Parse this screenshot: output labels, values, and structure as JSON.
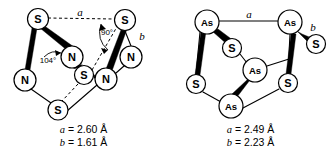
{
  "figure": {
    "panels": [
      {
        "id": "s4n4",
        "name": "tetrasulfur-tetranitride-cage",
        "atoms": [
          {
            "label": "S",
            "x": 38,
            "y": 19,
            "r": 10.5,
            "size": "sz1"
          },
          {
            "label": "S",
            "x": 125,
            "y": 20,
            "r": 10.5,
            "size": "sz1"
          },
          {
            "label": "N",
            "x": 72,
            "y": 57,
            "r": 11.0,
            "size": "sz1"
          },
          {
            "label": "N",
            "x": 131,
            "y": 57,
            "r": 11.0,
            "size": "sz1"
          },
          {
            "label": "N",
            "x": 25,
            "y": 80,
            "r": 11.0,
            "size": "sz1"
          },
          {
            "label": "S",
            "x": 84,
            "y": 75,
            "r": 9.5,
            "size": "sz1"
          },
          {
            "label": "N",
            "x": 106,
            "y": 79,
            "r": 11.0,
            "size": "sz1"
          },
          {
            "label": "S",
            "x": 58,
            "y": 110,
            "r": 10.0,
            "size": "sz1"
          }
        ],
        "measure_labels": [
          {
            "text": "a",
            "x": 80,
            "y": 12
          },
          {
            "text": "b",
            "x": 142,
            "y": 36
          }
        ],
        "angle_labels": [
          {
            "text": "104°",
            "x": 48,
            "y": 60
          },
          {
            "text": "90°",
            "x": 107,
            "y": 32
          }
        ],
        "caption": {
          "line1_symbol": "a",
          "line1_value": "= 2.60 Å",
          "line2_symbol": "b",
          "line2_value": "= 1.61 Å"
        }
      },
      {
        "id": "as4s4",
        "name": "tetraarsenic-tetrasulfide-cage",
        "atoms": [
          {
            "label": "As",
            "x": 40,
            "y": 22,
            "r": 12.0,
            "size": "sz2"
          },
          {
            "label": "As",
            "x": 123,
            "y": 22,
            "r": 12.0,
            "size": "sz2"
          },
          {
            "label": "S",
            "x": 65,
            "y": 48,
            "r": 9.5,
            "size": "sz1"
          },
          {
            "label": "S",
            "x": 149,
            "y": 44,
            "r": 9.5,
            "size": "sz1"
          },
          {
            "label": "As",
            "x": 88,
            "y": 70,
            "r": 12.0,
            "size": "sz2"
          },
          {
            "label": "S",
            "x": 29,
            "y": 84,
            "r": 9.5,
            "size": "sz1"
          },
          {
            "label": "S",
            "x": 121,
            "y": 83,
            "r": 9.5,
            "size": "sz1"
          },
          {
            "label": "As",
            "x": 64,
            "y": 106,
            "r": 12.0,
            "size": "sz2"
          }
        ],
        "measure_labels": [
          {
            "text": "a",
            "x": 82,
            "y": 14
          },
          {
            "text": "b",
            "x": 146,
            "y": 27
          }
        ],
        "angle_labels": [],
        "caption": {
          "line1_symbol": "a",
          "line1_value": "= 2.49 Å",
          "line2_symbol": "b",
          "line2_value": "= 2.23 Å"
        }
      }
    ]
  },
  "colors": {
    "ink": "#000000",
    "background": "#ffffff"
  }
}
